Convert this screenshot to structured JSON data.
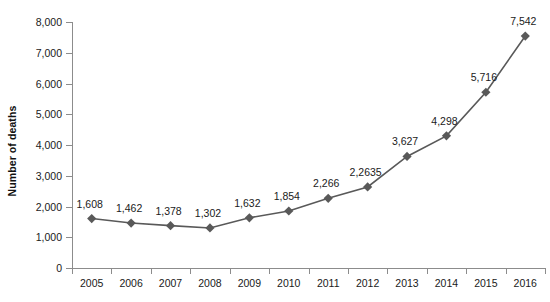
{
  "chart_data": {
    "type": "line",
    "title": "",
    "xlabel": "",
    "ylabel": "Number of deaths",
    "categories": [
      "2005",
      "2006",
      "2007",
      "2008",
      "2009",
      "2010",
      "2011",
      "2012",
      "2013",
      "2014",
      "2015",
      "2016"
    ],
    "values": [
      1608,
      1462,
      1378,
      1302,
      1632,
      1854,
      2266,
      2635,
      3627,
      4298,
      5716,
      7542
    ],
    "point_labels": [
      "1,608",
      "1,462",
      "1,378",
      "1,302",
      "1,632",
      "1,854",
      "2,266",
      "2,2635",
      "3,627",
      "4,298",
      "5,716",
      "7,542"
    ],
    "ylim": [
      0,
      8000
    ],
    "y_ticks": [
      0,
      1000,
      2000,
      3000,
      4000,
      5000,
      6000,
      7000,
      8000
    ],
    "y_tick_labels": [
      "0",
      "1,000",
      "2,000",
      "3,000",
      "4,000",
      "5,000",
      "6,000",
      "7,000",
      "8,000"
    ],
    "grid": false,
    "legend": "none",
    "series_color": "#595959",
    "marker": "diamond",
    "background": "#ffffff"
  }
}
